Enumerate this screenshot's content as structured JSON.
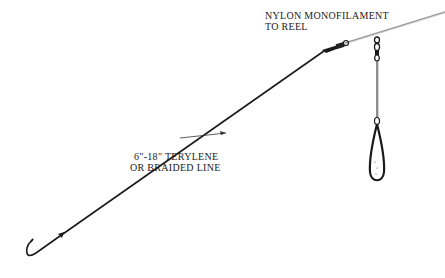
{
  "diagram": {
    "type": "fishing-rig-illustration",
    "labels": {
      "reel_line": {
        "line1": "NYLON MONOFILAMENT",
        "line2": "TO REEL"
      },
      "leader": {
        "line1": "6\"-18\" TERYLENE",
        "line2": "OR BRAIDED LINE"
      }
    },
    "components": [
      {
        "name": "nylon-monofilament-line",
        "label_ref": "reel_line"
      },
      {
        "name": "swivel",
        "label_ref": null
      },
      {
        "name": "leader-line",
        "label_ref": "leader"
      },
      {
        "name": "sinker-link",
        "label_ref": null
      },
      {
        "name": "sinker-weight",
        "label_ref": null
      },
      {
        "name": "hook",
        "label_ref": null
      }
    ],
    "colors": {
      "ink": "#1a1a1a",
      "monofilament": "#9a9a9a",
      "background": "#ffffff"
    }
  }
}
